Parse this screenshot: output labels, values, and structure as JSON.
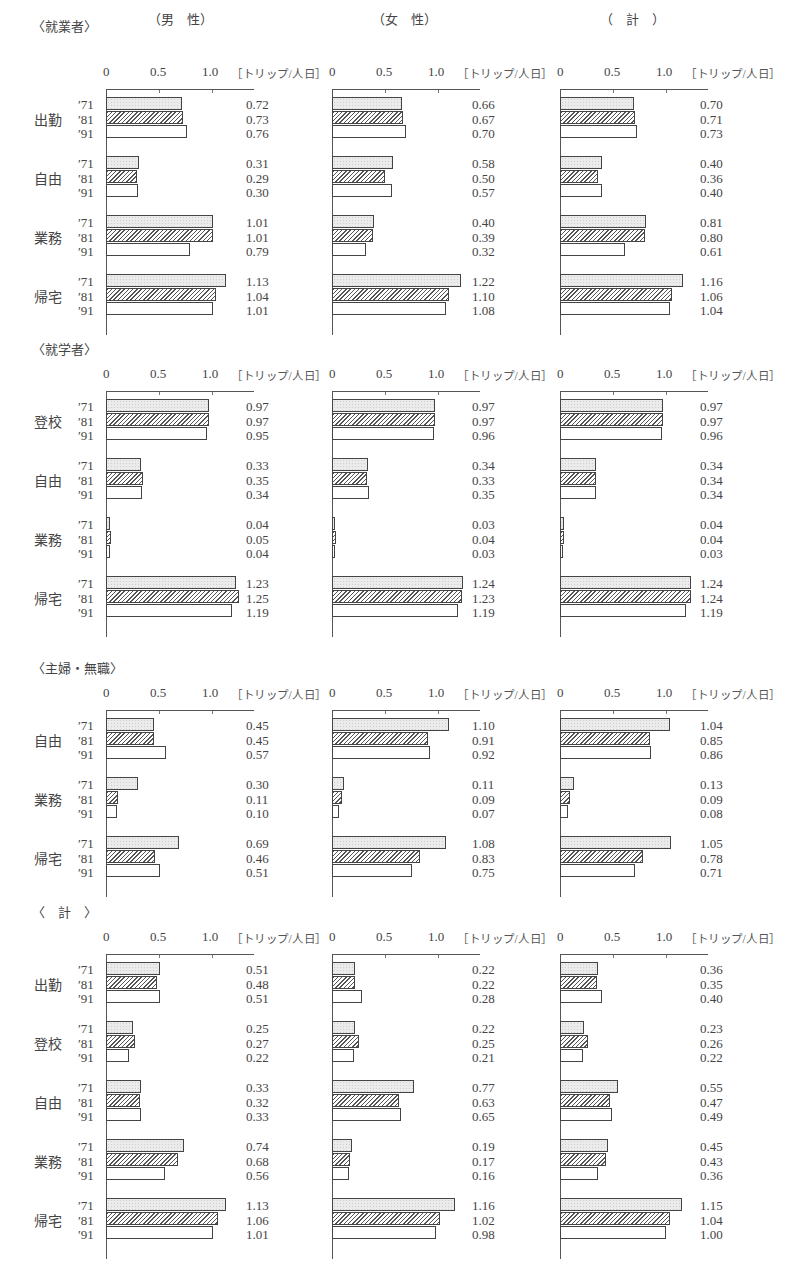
{
  "columns": [
    "（男　性）",
    "（女　性）",
    "（　計　）"
  ],
  "axis": {
    "ticks": [
      "0",
      "0.5",
      "1.0"
    ],
    "unit": "［トリップ/人日］"
  },
  "years": [
    "′71",
    "′81",
    "′91"
  ],
  "colors": {
    "y71": "#ebebeb",
    "y81": "hatched",
    "y91": "#ffffff",
    "border": "#444444"
  },
  "chart_data": {
    "type": "bar",
    "orientation": "horizontal",
    "unit": "トリップ/人日",
    "xlim": [
      0,
      1.3
    ],
    "xticks": [
      0,
      0.5,
      1.0
    ],
    "legend": [
      "'71 (dotted)",
      "'81 (hatched)",
      "'91 (white)"
    ],
    "sections": [
      {
        "title": "〈就業者〉",
        "top": 89,
        "groups": [
          {
            "label": "出勤",
            "male": [
              0.72,
              0.73,
              0.76
            ],
            "female": [
              0.66,
              0.67,
              0.7
            ],
            "total": [
              0.7,
              0.71,
              0.73
            ]
          },
          {
            "label": "自由",
            "male": [
              0.31,
              0.29,
              0.3
            ],
            "female": [
              0.58,
              0.5,
              0.57
            ],
            "total": [
              0.4,
              0.36,
              0.4
            ]
          },
          {
            "label": "業務",
            "male": [
              1.01,
              1.01,
              0.79
            ],
            "female": [
              0.4,
              0.39,
              0.32
            ],
            "total": [
              0.81,
              0.8,
              0.61
            ]
          },
          {
            "label": "帰宅",
            "male": [
              1.13,
              1.04,
              1.01
            ],
            "female": [
              1.22,
              1.1,
              1.08
            ],
            "total": [
              1.16,
              1.06,
              1.04
            ]
          }
        ]
      },
      {
        "title": "〈就学者〉",
        "top": 391,
        "groups": [
          {
            "label": "登校",
            "male": [
              0.97,
              0.97,
              0.95
            ],
            "female": [
              0.97,
              0.97,
              0.96
            ],
            "total": [
              0.97,
              0.97,
              0.96
            ]
          },
          {
            "label": "自由",
            "male": [
              0.33,
              0.35,
              0.34
            ],
            "female": [
              0.34,
              0.33,
              0.35
            ],
            "total": [
              0.34,
              0.34,
              0.34
            ]
          },
          {
            "label": "業務",
            "male": [
              0.04,
              0.05,
              0.04
            ],
            "female": [
              0.03,
              0.04,
              0.03
            ],
            "total": [
              0.04,
              0.04,
              0.03
            ]
          },
          {
            "label": "帰宅",
            "male": [
              1.23,
              1.25,
              1.19
            ],
            "female": [
              1.24,
              1.23,
              1.19
            ],
            "total": [
              1.24,
              1.24,
              1.19
            ]
          }
        ]
      },
      {
        "title": "〈主婦・無職〉",
        "top": 710,
        "groups": [
          {
            "label": "自由",
            "male": [
              0.45,
              0.45,
              0.57
            ],
            "female": [
              1.1,
              0.91,
              0.92
            ],
            "total": [
              1.04,
              0.85,
              0.86
            ]
          },
          {
            "label": "業務",
            "male": [
              0.3,
              0.11,
              0.1
            ],
            "female": [
              0.11,
              0.09,
              0.07
            ],
            "total": [
              0.13,
              0.09,
              0.08
            ]
          },
          {
            "label": "帰宅",
            "male": [
              0.69,
              0.46,
              0.51
            ],
            "female": [
              1.08,
              0.83,
              0.75
            ],
            "total": [
              1.05,
              0.78,
              0.71
            ]
          }
        ]
      },
      {
        "title": "〈　計　〉",
        "top": 954,
        "groups": [
          {
            "label": "出勤",
            "male": [
              0.51,
              0.48,
              0.51
            ],
            "female": [
              0.22,
              0.22,
              0.28
            ],
            "total": [
              0.36,
              0.35,
              0.4
            ]
          },
          {
            "label": "登校",
            "male": [
              0.25,
              0.27,
              0.22
            ],
            "female": [
              0.22,
              0.25,
              0.21
            ],
            "total": [
              0.23,
              0.26,
              0.22
            ]
          },
          {
            "label": "自由",
            "male": [
              0.33,
              0.32,
              0.33
            ],
            "female": [
              0.77,
              0.63,
              0.65
            ],
            "total": [
              0.55,
              0.47,
              0.49
            ]
          },
          {
            "label": "業務",
            "male": [
              0.74,
              0.68,
              0.56
            ],
            "female": [
              0.19,
              0.17,
              0.16
            ],
            "total": [
              0.45,
              0.43,
              0.36
            ]
          },
          {
            "label": "帰宅",
            "male": [
              1.13,
              1.06,
              1.01
            ],
            "female": [
              1.16,
              1.02,
              0.98
            ],
            "total": [
              1.15,
              1.04,
              1.0
            ]
          }
        ]
      }
    ]
  }
}
